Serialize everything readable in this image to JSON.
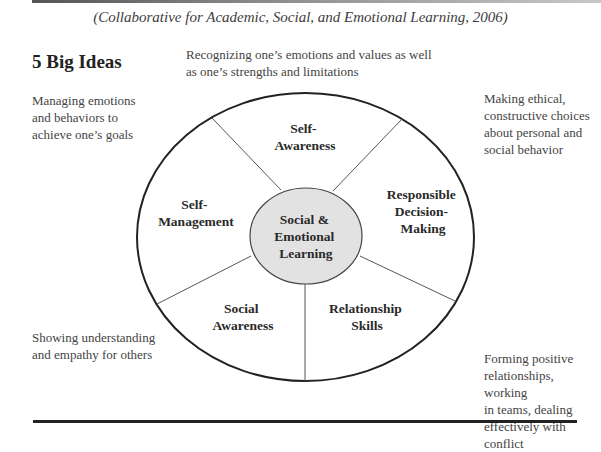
{
  "citation": "(Collaborative for Academic, Social, and Emotional Learning, 2006)",
  "heading": "5 Big Ideas",
  "center": {
    "lines": [
      "Social &",
      "Emotional",
      "Learning"
    ],
    "fill": "#e2e2e2"
  },
  "segments": [
    {
      "id": "self-awareness",
      "lines": [
        "Self-",
        "Awareness"
      ]
    },
    {
      "id": "responsible-decision-making",
      "lines": [
        "Responsible",
        "Decision-",
        "Making"
      ]
    },
    {
      "id": "relationship-skills",
      "lines": [
        "Relationship",
        "Skills"
      ]
    },
    {
      "id": "social-awareness",
      "lines": [
        "Social",
        "Awareness"
      ]
    },
    {
      "id": "self-management",
      "lines": [
        "Self-",
        "Management"
      ]
    }
  ],
  "descriptions": {
    "top": [
      "Recognizing one’s emotions and values as well",
      "as one’s strengths and limitations"
    ],
    "left": [
      "Managing emotions",
      "and behaviors to",
      "achieve one’s goals"
    ],
    "right": [
      "Making ethical,",
      "constructive choices",
      "about personal and",
      "social behavior"
    ],
    "bottom_left": [
      "Showing understanding",
      "and empathy for others"
    ],
    "bottom_right": [
      "Forming positive",
      "relationships, working",
      "in teams, dealing",
      "effectively with",
      "conflict"
    ]
  }
}
